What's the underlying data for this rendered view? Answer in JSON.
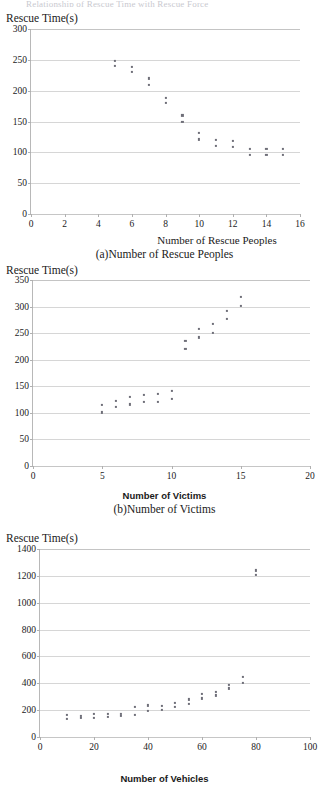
{
  "document": {
    "top_cut_text": "Relationship of Rescue Time with Rescue Force"
  },
  "figures": [
    {
      "id": "a",
      "y_axis_title": "Rescue Time(s)",
      "x_axis_title": "Number of Rescue Peoples",
      "caption": "(a)Number of Rescue Peoples"
    },
    {
      "id": "b",
      "y_axis_title": "Rescue Time(s)",
      "x_axis_title": "Number of Victims",
      "caption": "(b)Number of Victims"
    },
    {
      "id": "c",
      "y_axis_title": "Rescue Time(s)",
      "x_axis_title": "Number of Vehicles",
      "caption": ""
    }
  ],
  "chart_data": [
    {
      "type": "scatter",
      "title": "(a)Number of Rescue Peoples",
      "xlabel": "Number of Rescue Peoples",
      "ylabel": "Rescue Time(s)",
      "xlim": [
        0,
        16
      ],
      "ylim": [
        0,
        300
      ],
      "xticks": [
        0,
        2,
        4,
        6,
        8,
        10,
        12,
        14,
        16
      ],
      "yticks": [
        0,
        50,
        100,
        150,
        200,
        250,
        300
      ],
      "grid": "horizontal",
      "legend": "none",
      "marker_color": "#6e6e78",
      "points": [
        {
          "x": 5,
          "y": 248
        },
        {
          "x": 5,
          "y": 240
        },
        {
          "x": 6,
          "y": 239
        },
        {
          "x": 6,
          "y": 230
        },
        {
          "x": 7,
          "y": 220
        },
        {
          "x": 7,
          "y": 210
        },
        {
          "x": 8,
          "y": 188
        },
        {
          "x": 8,
          "y": 180
        },
        {
          "x": 9,
          "y": 160
        },
        {
          "x": 9,
          "y": 150
        },
        {
          "x": 10,
          "y": 132
        },
        {
          "x": 10,
          "y": 121
        },
        {
          "x": 11,
          "y": 120
        },
        {
          "x": 11,
          "y": 111
        },
        {
          "x": 12,
          "y": 118
        },
        {
          "x": 12,
          "y": 109
        },
        {
          "x": 13,
          "y": 105
        },
        {
          "x": 13,
          "y": 96
        },
        {
          "x": 14,
          "y": 106
        },
        {
          "x": 14,
          "y": 96
        },
        {
          "x": 15,
          "y": 106
        },
        {
          "x": 15,
          "y": 96
        }
      ]
    },
    {
      "type": "scatter",
      "title": "(b)Number of Victims",
      "xlabel": "Number of Victims",
      "ylabel": "Rescue Time(s)",
      "xlim": [
        0,
        20
      ],
      "ylim": [
        0,
        350
      ],
      "xticks": [
        0,
        5,
        10,
        15,
        20
      ],
      "yticks": [
        0,
        50,
        100,
        150,
        200,
        250,
        300,
        350
      ],
      "grid": "horizontal",
      "legend": "none",
      "marker_color": "#6e6e78",
      "points": [
        {
          "x": 5,
          "y": 115
        },
        {
          "x": 5,
          "y": 101
        },
        {
          "x": 6,
          "y": 123
        },
        {
          "x": 6,
          "y": 111
        },
        {
          "x": 7,
          "y": 130
        },
        {
          "x": 7,
          "y": 116
        },
        {
          "x": 8,
          "y": 134
        },
        {
          "x": 8,
          "y": 120
        },
        {
          "x": 9,
          "y": 136
        },
        {
          "x": 9,
          "y": 121
        },
        {
          "x": 10,
          "y": 141
        },
        {
          "x": 10,
          "y": 126
        },
        {
          "x": 11,
          "y": 235
        },
        {
          "x": 11,
          "y": 221
        },
        {
          "x": 12,
          "y": 258
        },
        {
          "x": 12,
          "y": 242
        },
        {
          "x": 13,
          "y": 267
        },
        {
          "x": 13,
          "y": 251
        },
        {
          "x": 14,
          "y": 292
        },
        {
          "x": 14,
          "y": 277
        },
        {
          "x": 15,
          "y": 318
        },
        {
          "x": 15,
          "y": 301
        }
      ]
    },
    {
      "type": "scatter",
      "title": "",
      "xlabel": "Number of Vehicles",
      "ylabel": "Rescue Time(s)",
      "xlim": [
        0,
        100
      ],
      "ylim": [
        0,
        1400
      ],
      "xticks": [
        0,
        20,
        40,
        60,
        80,
        100
      ],
      "yticks": [
        0,
        200,
        400,
        600,
        800,
        1000,
        1200,
        1400
      ],
      "grid": "horizontal",
      "legend": "none",
      "marker_color": "#6e6e78",
      "points": [
        {
          "x": 10,
          "y": 163
        },
        {
          "x": 10,
          "y": 135
        },
        {
          "x": 15,
          "y": 158
        },
        {
          "x": 15,
          "y": 140
        },
        {
          "x": 20,
          "y": 172
        },
        {
          "x": 20,
          "y": 145
        },
        {
          "x": 25,
          "y": 174
        },
        {
          "x": 25,
          "y": 150
        },
        {
          "x": 30,
          "y": 173
        },
        {
          "x": 30,
          "y": 158
        },
        {
          "x": 35,
          "y": 222
        },
        {
          "x": 35,
          "y": 165
        },
        {
          "x": 40,
          "y": 235
        },
        {
          "x": 40,
          "y": 195
        },
        {
          "x": 45,
          "y": 233
        },
        {
          "x": 45,
          "y": 202
        },
        {
          "x": 50,
          "y": 255
        },
        {
          "x": 50,
          "y": 227
        },
        {
          "x": 55,
          "y": 280
        },
        {
          "x": 55,
          "y": 247
        },
        {
          "x": 60,
          "y": 323
        },
        {
          "x": 60,
          "y": 287
        },
        {
          "x": 65,
          "y": 338
        },
        {
          "x": 65,
          "y": 310
        },
        {
          "x": 70,
          "y": 390
        },
        {
          "x": 70,
          "y": 362
        },
        {
          "x": 75,
          "y": 445
        },
        {
          "x": 75,
          "y": 404
        },
        {
          "x": 80,
          "y": 1240
        },
        {
          "x": 80,
          "y": 1208
        }
      ]
    }
  ]
}
